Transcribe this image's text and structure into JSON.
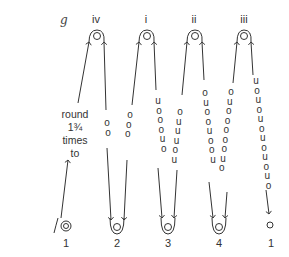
{
  "figure": {
    "panel_label": "g",
    "top_labels": [
      "iv",
      "i",
      "ii",
      "iii"
    ],
    "bottom_labels": [
      "1",
      "2",
      "3",
      "4",
      "1"
    ],
    "annotation": [
      "round",
      "1¾",
      "times",
      "to"
    ],
    "columns": [
      {
        "id": "iv",
        "up_letters": [],
        "down_letters": [
          "o",
          "o"
        ]
      },
      {
        "id": "i",
        "up_letters": [
          "o",
          "o",
          "o"
        ],
        "down_letters": [
          "u",
          "o",
          "o",
          "o",
          "u",
          "o"
        ]
      },
      {
        "id": "ii",
        "up_letters": [
          "o",
          "u",
          "u",
          "u",
          "o",
          "u"
        ],
        "down_letters": [
          "o",
          "u",
          "o",
          "o",
          "u",
          "o",
          "o",
          "u"
        ]
      },
      {
        "id": "iii",
        "up_letters": [
          "o",
          "u",
          "o",
          "o",
          "o",
          "o",
          "o",
          "u",
          "o"
        ],
        "down_letters": [
          "u",
          "o",
          "u",
          "o",
          "u",
          "o",
          "u",
          "o",
          "u",
          "o",
          "u",
          "o"
        ]
      }
    ],
    "colors": {
      "line": "#333333",
      "text": "#333333"
    }
  }
}
